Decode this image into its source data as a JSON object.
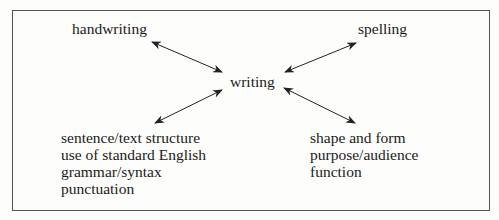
{
  "diagram": {
    "center": "writing",
    "top_left": "handwriting",
    "top_right": "spelling",
    "bottom_left": [
      "sentence/text structure",
      "use of standard English",
      "grammar/syntax",
      "punctuation"
    ],
    "bottom_right": [
      "shape and form",
      "purpose/audience",
      "function"
    ],
    "arrows": [
      {
        "from": "writing",
        "to": "handwriting",
        "style": "double-headed"
      },
      {
        "from": "writing",
        "to": "spelling",
        "style": "double-headed"
      },
      {
        "from": "writing",
        "to": "bottom_left",
        "style": "double-headed"
      },
      {
        "from": "writing",
        "to": "bottom_right",
        "style": "double-headed"
      }
    ]
  }
}
